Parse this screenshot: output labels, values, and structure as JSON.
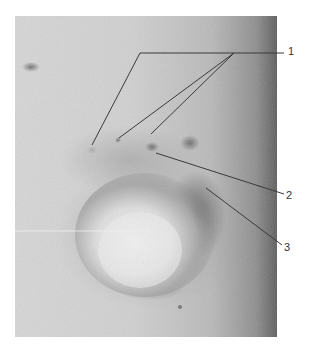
{
  "figure": {
    "type": "grayscale clinical photograph with numbered leader-line annotations",
    "labels": [
      {
        "id": "1",
        "text": "1"
      },
      {
        "id": "2",
        "text": "2"
      },
      {
        "id": "3",
        "text": "3"
      }
    ],
    "colors": {
      "background": "#ffffff",
      "skin_light": "#d9d9d9",
      "skin_dark_edge": "#6f6f6f",
      "lesion_dark": "#5a5a5a",
      "leader_line": "#3a3a3a",
      "label_text": "#333333"
    }
  }
}
